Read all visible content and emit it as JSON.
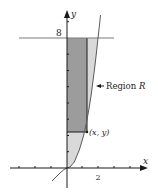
{
  "diagram": {
    "title": "",
    "axes": {
      "x_label": "x",
      "y_label": "y",
      "x_tick_label": "2",
      "y_tick_label": "8"
    },
    "curve": {
      "equation": "y = x^3"
    },
    "horizontal_line": {
      "value": "8"
    },
    "annotations": {
      "region_label": "Region ",
      "region_name": "R",
      "point_label": "(x, y)"
    },
    "colors": {
      "axis": "#1a1a1a",
      "curve": "#5a5a5a",
      "line": "#7a7a7a",
      "region_light": "#d9d9d9",
      "rect_dark": "#9c9c9c",
      "rect_edge": "#1a1a1a"
    }
  }
}
